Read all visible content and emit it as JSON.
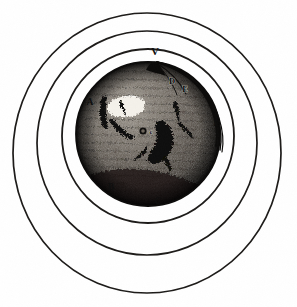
{
  "figure": {
    "subject_name": "spotted-sphere",
    "background_color": "#ffffff",
    "ink_color": "#1a1a1a",
    "sphere": {
      "center_x": 148,
      "center_y": 134,
      "radius": 72,
      "dark_tone": "#2b2723",
      "mid_tone": "#4a443d",
      "light_tone": "#8d867b",
      "highlight_tone": "#f2efe8"
    },
    "rings": [
      {
        "name": "outer-ring",
        "center_x": 147,
        "center_y": 153,
        "rx": 134,
        "ry": 140,
        "stroke_width": 1.6
      },
      {
        "name": "middle-ring",
        "center_x": 147,
        "center_y": 143,
        "rx": 110,
        "ry": 112,
        "stroke_width": 1.6
      },
      {
        "name": "inner-ring",
        "center_x": 148,
        "center_y": 136,
        "rx": 86,
        "ry": 87,
        "stroke_width": 1.7
      }
    ],
    "ray_arcs": {
      "name": "light-rays-from-vertex",
      "count": 4,
      "origin_label": "V",
      "terminus_label": "F"
    },
    "labels": [
      {
        "id": "V",
        "text": "V",
        "x": 155,
        "y": 55,
        "size": 11,
        "style": "dark",
        "position": "top-of-sphere"
      },
      {
        "id": "D",
        "text": "D",
        "x": 172,
        "y": 84,
        "size": 8,
        "style": "light",
        "position": "upper-right-inside"
      },
      {
        "id": "E",
        "text": "E",
        "x": 185,
        "y": 92,
        "size": 8,
        "style": "light",
        "position": "upper-right-edge"
      },
      {
        "id": "A",
        "text": "A",
        "x": 90,
        "y": 105,
        "size": 9,
        "style": "dark",
        "position": "left-edge"
      },
      {
        "id": "F",
        "text": "F",
        "x": 216,
        "y": 126,
        "size": 8,
        "style": "dark",
        "position": "right-edge"
      },
      {
        "id": "c",
        "text": "c",
        "x": 151,
        "y": 133,
        "size": 7,
        "style": "light",
        "position": "center-spot"
      },
      {
        "id": "B",
        "text": "B",
        "x": 111,
        "y": 190,
        "size": 9,
        "style": "dark",
        "position": "lower-left"
      },
      {
        "id": "C",
        "text": "C",
        "x": 158,
        "y": 204,
        "size": 9,
        "style": "dark",
        "position": "bottom"
      }
    ],
    "surface_features": [
      {
        "name": "bright-patch-upper-left",
        "kind": "highlight"
      },
      {
        "name": "dark-crater-chain-left",
        "kind": "shadow"
      },
      {
        "name": "dark-figure-center",
        "kind": "shadow"
      },
      {
        "name": "dark-streak-right",
        "kind": "shadow"
      },
      {
        "name": "small-ring-crater",
        "kind": "crater"
      },
      {
        "name": "limb-shadow-bottom",
        "kind": "shadow"
      }
    ]
  }
}
